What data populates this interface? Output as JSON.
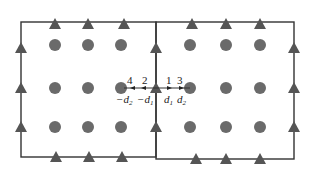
{
  "diagram": {
    "colors": {
      "line": "#333333",
      "circle": "#6a6a6a",
      "triangle": "#555555"
    },
    "boxes": [
      {
        "x1": 21,
        "y1": 22,
        "x2": 156,
        "y2": 157
      },
      {
        "x1": 156,
        "y1": 22,
        "x2": 294,
        "y2": 159
      }
    ],
    "circles": {
      "cols": [
        55,
        88,
        121,
        190,
        226,
        260
      ],
      "rows": [
        45,
        88,
        127
      ]
    },
    "triangles": {
      "top": [
        [
          55,
          24
        ],
        [
          88,
          24
        ],
        [
          124,
          24
        ],
        [
          192,
          24
        ],
        [
          226,
          24
        ],
        [
          260,
          24
        ]
      ],
      "bottom_left": [
        [
          56,
          157
        ],
        [
          89,
          157
        ],
        [
          122,
          157
        ]
      ],
      "bottom_right": [
        [
          196,
          159
        ],
        [
          226,
          159
        ],
        [
          260,
          159
        ]
      ],
      "left": [
        [
          21,
          48
        ],
        [
          21,
          88
        ],
        [
          21,
          127
        ]
      ],
      "middle": [
        [
          156,
          48
        ],
        [
          156,
          88
        ],
        [
          156,
          127
        ]
      ],
      "right": [
        [
          294,
          48
        ],
        [
          294,
          88
        ],
        [
          294,
          127
        ]
      ]
    },
    "arrow_labels": {
      "n4": "4",
      "n2": "2",
      "n1": "1",
      "n3": "3"
    },
    "distance_labels": {
      "neg_d2": "−d",
      "neg_d2_sub": "2",
      "neg_d1": "−d",
      "neg_d1_sub": "1",
      "d1": "d",
      "d1_sub": "1",
      "d2": "d",
      "d2_sub": "2"
    }
  }
}
